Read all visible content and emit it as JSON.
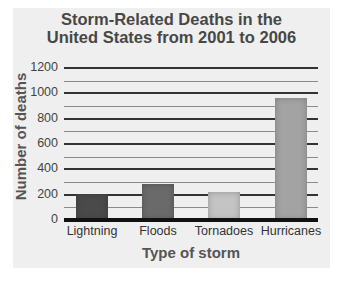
{
  "chart_data": {
    "type": "bar",
    "title": "Storm-Related Deaths in the United States from 2001 to 2006",
    "title_lines": [
      "Storm-Related Deaths in the",
      "United States from 2001 to 2006"
    ],
    "xlabel": "Type of storm",
    "ylabel": "Number of deaths",
    "categories": [
      "Lightning",
      "Floods",
      "Tornadoes",
      "Hurricanes"
    ],
    "values": [
      205,
      285,
      220,
      960
    ],
    "bar_colors": [
      "#4a4a4a",
      "#6a6a6a",
      "#c4c4c4",
      "#a3a3a3"
    ],
    "yticks": [
      0,
      200,
      400,
      600,
      800,
      1000,
      1200
    ],
    "ylim": [
      0,
      1200
    ],
    "grid": true,
    "minor_grid_step": 100,
    "legend": null
  },
  "colors": {
    "panel_bg": "#efefef",
    "title_text": "#474747",
    "major_grid": "#333333",
    "minor_grid": "#8a8a8a",
    "baseline": "#111111"
  }
}
